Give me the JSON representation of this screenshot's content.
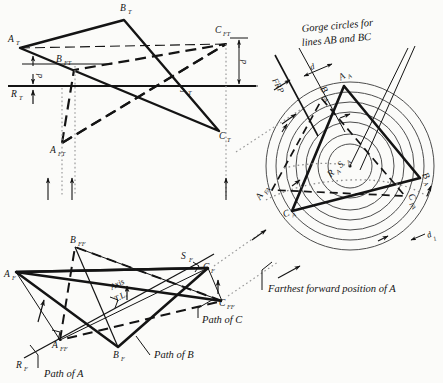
{
  "figure": {
    "background": "#fbfbf9",
    "ink": "#141414"
  },
  "top_view": {
    "points": [
      {
        "name": "A_T",
        "label": "A",
        "sub": "T",
        "x": 12,
        "y": 42
      },
      {
        "name": "B_T",
        "label": "B",
        "sub": "T",
        "x": 124,
        "y": 11
      },
      {
        "name": "C_T",
        "label": "C",
        "sub": "T",
        "x": 219,
        "y": 139
      },
      {
        "name": "B_FT",
        "label": "B",
        "sub": "FT",
        "x": 64,
        "y": 62
      },
      {
        "name": "C_FT",
        "label": "C",
        "sub": "FT",
        "x": 222,
        "y": 33
      },
      {
        "name": "A_FT",
        "label": "A",
        "sub": "FT",
        "x": 61,
        "y": 150
      },
      {
        "name": "R_T",
        "label": "R",
        "sub": "T",
        "x": 14,
        "y": 93
      },
      {
        "name": "S_T",
        "label": "S",
        "sub": "T",
        "x": 183,
        "y": 90
      }
    ],
    "dimension_labels": [
      "d",
      "d"
    ],
    "reference_line_name": "horizontal-reference-line"
  },
  "front_view": {
    "points": [
      {
        "name": "A_F",
        "label": "A",
        "sub": "F",
        "x": 8,
        "y": 274
      },
      {
        "name": "B_F",
        "label": "B",
        "sub": "F",
        "x": 118,
        "y": 354
      },
      {
        "name": "C_F",
        "label": "C",
        "sub": "F",
        "x": 205,
        "y": 269
      },
      {
        "name": "S_F",
        "label": "S",
        "sub": "F",
        "x": 188,
        "y": 258
      },
      {
        "name": "B_FF",
        "label": "B",
        "sub": "FF",
        "x": 73,
        "y": 240
      },
      {
        "name": "A_FF",
        "label": "A",
        "sub": "FF",
        "x": 56,
        "y": 343
      },
      {
        "name": "C_FF",
        "label": "C",
        "sub": "FF",
        "x": 223,
        "y": 291
      },
      {
        "name": "R_F",
        "label": "R",
        "sub": "F",
        "x": 20,
        "y": 364
      }
    ],
    "axis_label_line1": "Axis",
    "axis_label_line2": "T.L.",
    "annotations": [
      {
        "name": "path-of-a-label",
        "text": "Path of A"
      },
      {
        "name": "path-of-b-label",
        "text": "Path of B"
      },
      {
        "name": "path-of-c-label",
        "text": "Path of C"
      }
    ]
  },
  "auxiliary_view": {
    "heading_line1": "Gorge circles for",
    "heading_line2": "lines AB and BC",
    "frp_label": "FRP",
    "dim_d": "d",
    "dim_d1": "d",
    "dim_d1_sub": "1",
    "center_label": "R",
    "center_sub_1": "A",
    "center_label_2": "S",
    "center_sub_2": "A",
    "points": [
      {
        "name": "A_A",
        "label": "A",
        "sub": "A",
        "x": 345,
        "y": 78
      },
      {
        "name": "B_A",
        "label": "B",
        "sub": "A",
        "x": 424,
        "y": 178
      },
      {
        "name": "C_A",
        "label": "C",
        "sub": "A",
        "x": 288,
        "y": 216
      },
      {
        "name": "B_FA",
        "label": "B",
        "sub": "FA",
        "x": 322,
        "y": 92
      },
      {
        "name": "C_FA",
        "label": "C",
        "sub": "FA",
        "x": 410,
        "y": 199
      },
      {
        "name": "A_FA",
        "label": "A",
        "sub": "FA",
        "x": 263,
        "y": 196
      }
    ],
    "circle_count": 7
  },
  "callouts": {
    "farthest_forward": "Farthest forward position of A"
  }
}
